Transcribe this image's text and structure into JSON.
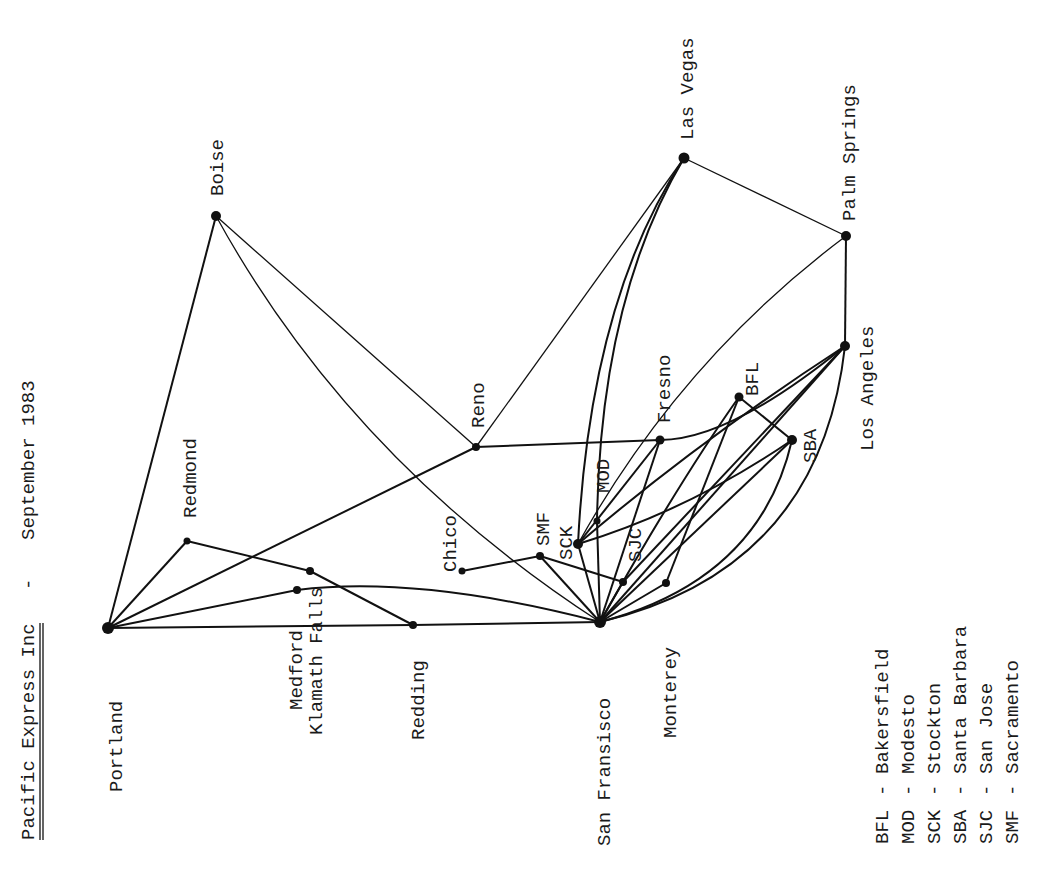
{
  "title": {
    "company": "Pacific Express Inc",
    "separator": "-",
    "date": "September 1983"
  },
  "cities": [
    {
      "id": "portland",
      "label": "Portland",
      "x": 108,
      "y": 628,
      "r": 6
    },
    {
      "id": "boise",
      "label": "Boise",
      "x": 216,
      "y": 216,
      "r": 5
    },
    {
      "id": "redmond",
      "label": "Redmond",
      "x": 187,
      "y": 541,
      "r": 3.5
    },
    {
      "id": "klamath_falls",
      "label": "Klamath Falls",
      "x": 310,
      "y": 571,
      "r": 4
    },
    {
      "id": "medford",
      "label": "Medford",
      "x": 297,
      "y": 590,
      "r": 4
    },
    {
      "id": "redding",
      "label": "Redding",
      "x": 413,
      "y": 625,
      "r": 4
    },
    {
      "id": "reno",
      "label": "Reno",
      "x": 476,
      "y": 447,
      "r": 4
    },
    {
      "id": "chico",
      "label": "Chico",
      "x": 462,
      "y": 571,
      "r": 3.5
    },
    {
      "id": "smf",
      "label": "SMF",
      "x": 540,
      "y": 556,
      "r": 4
    },
    {
      "id": "sck",
      "label": "SCK",
      "x": 578,
      "y": 544,
      "r": 5
    },
    {
      "id": "mod",
      "label": "MOD",
      "x": 597,
      "y": 521,
      "r": 3.5
    },
    {
      "id": "sjc",
      "label": "SJC",
      "x": 623,
      "y": 582,
      "r": 4
    },
    {
      "id": "san_francisco",
      "label": "San Fransisco",
      "x": 600,
      "y": 622,
      "r": 6
    },
    {
      "id": "monterey",
      "label": "Monterey",
      "x": 666,
      "y": 583,
      "r": 4
    },
    {
      "id": "fresno",
      "label": "Fresno",
      "x": 660,
      "y": 440,
      "r": 4.5
    },
    {
      "id": "las_vegas",
      "label": "Las Vegas",
      "x": 684,
      "y": 158,
      "r": 5.5
    },
    {
      "id": "bfl",
      "label": "BFL",
      "x": 739,
      "y": 397,
      "r": 4.5
    },
    {
      "id": "sba",
      "label": "SBA",
      "x": 792,
      "y": 440,
      "r": 5
    },
    {
      "id": "los_angeles",
      "label": "Los Angeles",
      "x": 845,
      "y": 346,
      "r": 5
    },
    {
      "id": "palm_springs",
      "label": "Palm Springs",
      "x": 846,
      "y": 236,
      "r": 5
    }
  ],
  "legend": [
    {
      "code": "BFL",
      "name": "Bakersfield"
    },
    {
      "code": "MOD",
      "name": "Modesto"
    },
    {
      "code": "SCK",
      "name": "Stockton"
    },
    {
      "code": "SBA",
      "name": "Santa Barbara"
    },
    {
      "code": "SJC",
      "name": "San Jose"
    },
    {
      "code": "SMF",
      "name": "Sacramento"
    }
  ],
  "routes": [
    {
      "from": "portland",
      "to": "boise"
    },
    {
      "from": "portland",
      "to": "redmond"
    },
    {
      "from": "portland",
      "to": "reno"
    },
    {
      "from": "portland",
      "to": "medford"
    },
    {
      "from": "portland",
      "to": "redding"
    },
    {
      "from": "redmond",
      "to": "klamath_falls"
    },
    {
      "from": "klamath_falls",
      "to": "redding"
    },
    {
      "from": "medford",
      "to": "san_francisco"
    },
    {
      "from": "redding",
      "to": "san_francisco"
    },
    {
      "from": "boise",
      "to": "reno"
    },
    {
      "from": "boise",
      "to": "san_francisco"
    },
    {
      "from": "reno",
      "to": "fresno"
    },
    {
      "from": "reno",
      "to": "las_vegas"
    },
    {
      "from": "fresno",
      "to": "los_angeles"
    },
    {
      "from": "chico",
      "to": "smf"
    },
    {
      "from": "smf",
      "to": "sjc"
    },
    {
      "from": "smf",
      "to": "san_francisco"
    },
    {
      "from": "sck",
      "to": "san_francisco"
    },
    {
      "from": "sck",
      "to": "las_vegas"
    },
    {
      "from": "mod",
      "to": "las_vegas"
    },
    {
      "from": "mod",
      "to": "san_francisco"
    },
    {
      "from": "sck",
      "to": "fresno"
    },
    {
      "from": "sck",
      "to": "los_angeles"
    },
    {
      "from": "sck",
      "to": "sba"
    },
    {
      "from": "sck",
      "to": "palm_springs"
    },
    {
      "from": "sjc",
      "to": "los_angeles"
    },
    {
      "from": "monterey",
      "to": "bfl"
    },
    {
      "from": "bfl",
      "to": "sba"
    },
    {
      "from": "san_francisco",
      "to": "fresno"
    },
    {
      "from": "san_francisco",
      "to": "bfl"
    },
    {
      "from": "san_francisco",
      "to": "sba"
    },
    {
      "from": "san_francisco",
      "to": "los_angeles"
    },
    {
      "from": "san_francisco",
      "to": "sjc"
    },
    {
      "from": "san_francisco",
      "to": "monterey"
    },
    {
      "from": "las_vegas",
      "to": "palm_springs"
    },
    {
      "from": "palm_springs",
      "to": "los_angeles"
    }
  ]
}
